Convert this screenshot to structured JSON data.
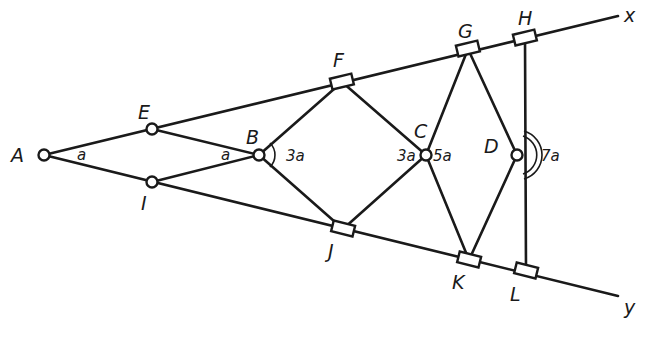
{
  "diagram": {
    "type": "linkage",
    "stroke_color": "#1a1a1a",
    "background": "#ffffff",
    "points": {
      "A": {
        "x": 44,
        "y": 155,
        "kind": "pivot"
      },
      "E": {
        "x": 152,
        "y": 129,
        "kind": "pivot"
      },
      "I": {
        "x": 152,
        "y": 182,
        "kind": "pivot"
      },
      "B": {
        "x": 259,
        "y": 155,
        "kind": "pivot"
      },
      "F": {
        "x": 342,
        "y": 82,
        "kind": "slider"
      },
      "J": {
        "x": 343,
        "y": 229,
        "kind": "slider"
      },
      "C": {
        "x": 426,
        "y": 155,
        "kind": "pivot"
      },
      "G": {
        "x": 468,
        "y": 49,
        "kind": "slider"
      },
      "K": {
        "x": 469,
        "y": 260,
        "kind": "slider"
      },
      "D": {
        "x": 517,
        "y": 155,
        "kind": "pivot"
      },
      "H": {
        "x": 525,
        "y": 38,
        "kind": "slider"
      },
      "L": {
        "x": 526,
        "y": 271,
        "kind": "slider"
      }
    },
    "labels": {
      "A": "A",
      "B": "B",
      "C": "C",
      "D": "D",
      "E": "E",
      "F": "F",
      "G": "G",
      "H": "H",
      "I": "I",
      "J": "J",
      "K": "K",
      "L": "L",
      "x": "x",
      "y": "y"
    },
    "angles": {
      "angle_A": "a",
      "angle_B_left": "a",
      "angle_B_right": "3a",
      "angle_C_left": "3a",
      "angle_C_right": "5a",
      "angle_D_right": "7a"
    }
  }
}
